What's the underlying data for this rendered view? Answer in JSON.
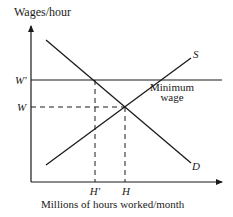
{
  "diagram": {
    "type": "supply-demand-minimum-wage",
    "y_axis_label": "Wages/hour",
    "x_axis_label": "Millions of hours worked/month",
    "curves": [
      {
        "name": "supply",
        "label": "S"
      },
      {
        "name": "demand",
        "label": "D"
      }
    ],
    "price_levels": [
      {
        "name": "minimum-wage",
        "tick_label": "W'",
        "line_label_1": "Minimum",
        "line_label_2": "wage"
      },
      {
        "name": "equilibrium-wage",
        "tick_label": "W"
      }
    ],
    "quantity_levels": [
      {
        "name": "min-wage-quantity",
        "tick_label": "H'"
      },
      {
        "name": "equilibrium-quantity",
        "tick_label": "H"
      }
    ],
    "colors": {
      "ink": "#1a1a1a",
      "background": "#ffffff"
    }
  }
}
